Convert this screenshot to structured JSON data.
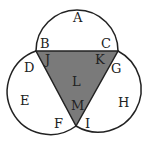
{
  "diagram": {
    "type": "three-circle region diagram with shaded central triangle",
    "shade_color": "#7a7a7a",
    "stroke_color": "#222222",
    "labels": [
      {
        "id": "A",
        "text": "A",
        "x": 73,
        "y": 22
      },
      {
        "id": "B",
        "text": "B",
        "x": 40,
        "y": 48
      },
      {
        "id": "C",
        "text": "C",
        "x": 101,
        "y": 48
      },
      {
        "id": "D",
        "text": "D",
        "x": 24,
        "y": 72
      },
      {
        "id": "J",
        "text": "J",
        "x": 45,
        "y": 64
      },
      {
        "id": "K",
        "text": "K",
        "x": 95,
        "y": 64
      },
      {
        "id": "G",
        "text": "G",
        "x": 111,
        "y": 73
      },
      {
        "id": "L",
        "text": "L",
        "x": 72,
        "y": 86
      },
      {
        "id": "E",
        "text": "E",
        "x": 20,
        "y": 105
      },
      {
        "id": "H",
        "text": "H",
        "x": 118,
        "y": 107
      },
      {
        "id": "M",
        "text": "M",
        "x": 71,
        "y": 110
      },
      {
        "id": "F",
        "text": "F",
        "x": 54,
        "y": 128
      },
      {
        "id": "I",
        "text": "I",
        "x": 85,
        "y": 128
      }
    ]
  }
}
